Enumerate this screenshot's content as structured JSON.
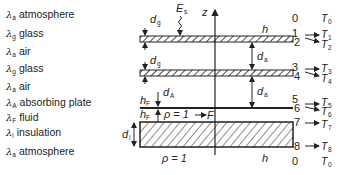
{
  "legend": [
    {
      "symbol": "λ",
      "sub": "a",
      "label": "atmosphere",
      "y": 16
    },
    {
      "symbol": "λ",
      "sub": "g",
      "label": "glass",
      "y": 35
    },
    {
      "symbol": "λ",
      "sub": "a",
      "label": "air",
      "y": 53
    },
    {
      "symbol": "λ",
      "sub": "g",
      "label": "glass",
      "y": 70
    },
    {
      "symbol": "λ",
      "sub": "a",
      "label": "air",
      "y": 88
    },
    {
      "symbol": "λ",
      "sub": "A",
      "label": "absorbing plate",
      "y": 104
    },
    {
      "symbol": "λ",
      "sub": "F",
      "label": "fluid",
      "y": 119
    },
    {
      "symbol": "λ",
      "sub": "i",
      "label": "insulation",
      "y": 134
    },
    {
      "symbol": "λ",
      "sub": "a",
      "label": "atmosphere",
      "y": 153
    }
  ],
  "diagram": {
    "axis_label": "z",
    "irradiance_label": "E",
    "irradiance_sub": "s",
    "height_label": "h",
    "dims": {
      "d_g": "d",
      "g_sub": "g",
      "d_a": "d",
      "a_sub": "a",
      "d_A": "d",
      "A_sub": "A",
      "h_F": "h",
      "F_sub": "F",
      "d_i": "d",
      "i_sub": "i"
    },
    "density_top": "ρ = 1",
    "density_bottom": "ρ = 1",
    "flow_label": "F",
    "layer_numbers": [
      "0",
      "1",
      "2",
      "3",
      "4",
      "5",
      "6",
      "7",
      "8",
      "0"
    ],
    "temperatures": [
      {
        "T": "T",
        "sub": "0"
      },
      {
        "T": "T",
        "sub": "1"
      },
      {
        "T": "T",
        "sub": "2"
      },
      {
        "T": "T",
        "sub": "3"
      },
      {
        "T": "T",
        "sub": "4"
      },
      {
        "T": "T",
        "sub": "5"
      },
      {
        "T": "T",
        "sub": "6"
      },
      {
        "T": "T",
        "sub": "7"
      },
      {
        "T": "T",
        "sub": "8"
      },
      {
        "T": "T",
        "sub": "0"
      }
    ]
  }
}
